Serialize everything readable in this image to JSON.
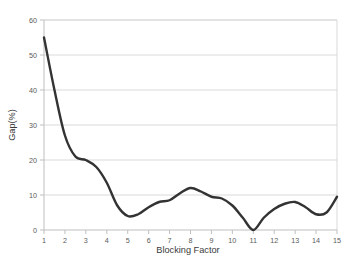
{
  "chart_data": {
    "type": "line",
    "title": "",
    "xlabel": "Blocking Factor",
    "ylabel": "Gap(%)",
    "xlim": [
      1,
      15
    ],
    "ylim": [
      0,
      60
    ],
    "grid": true,
    "grid_axis": "y",
    "legend": false,
    "legend_position": "none",
    "line_color": "#333333",
    "grid_color": "#d9d9d9",
    "axis_color": "#bfbfbf",
    "x_ticks": [
      1,
      2,
      3,
      4,
      5,
      6,
      7,
      8,
      9,
      10,
      11,
      12,
      13,
      14,
      15
    ],
    "x_tick_labels": [
      "1",
      "2",
      "3",
      "4",
      "5",
      "6",
      "7",
      "8",
      "9",
      "10",
      "11",
      "12",
      "13",
      "14",
      "15"
    ],
    "y_ticks": [
      0,
      10,
      20,
      30,
      40,
      50,
      60
    ],
    "y_tick_labels": [
      "0",
      "10",
      "20",
      "30",
      "40",
      "50",
      "60"
    ],
    "series": [
      {
        "name": "Gap",
        "x": [
          1,
          1.5,
          2,
          2.5,
          3,
          3.5,
          4,
          4.5,
          5,
          5.5,
          6,
          6.5,
          7,
          7.5,
          8,
          8.5,
          9,
          9.5,
          10,
          10.5,
          11,
          11.5,
          12,
          12.5,
          13,
          13.5,
          14,
          14.5,
          15
        ],
        "values": [
          55,
          40,
          27,
          21,
          20,
          18,
          13.5,
          7,
          4,
          4.5,
          6.5,
          8,
          8.5,
          10.5,
          12,
          11,
          9.5,
          9,
          7,
          3.5,
          0,
          3.5,
          6,
          7.5,
          8,
          6.5,
          4.5,
          5,
          9.5
        ]
      }
    ]
  }
}
